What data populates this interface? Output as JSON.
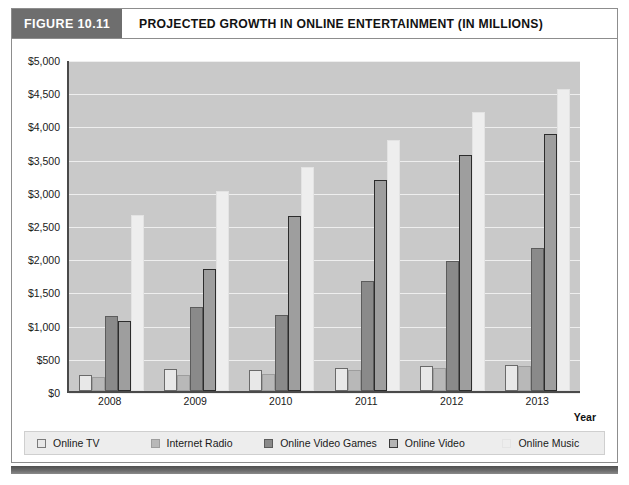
{
  "header": {
    "figure_tag": "FIGURE 10.11",
    "title": "PROJECTED GROWTH IN ONLINE ENTERTAINMENT (IN MILLIONS)"
  },
  "axis": {
    "x_title": "Year",
    "y_ticks": [
      "$0",
      "$500",
      "$1,000",
      "$1,500",
      "$2,000",
      "$2,500",
      "$3,000",
      "$3,500",
      "$4,000",
      "$4,500",
      "$5,000"
    ]
  },
  "legend": {
    "items": [
      {
        "label": "Online TV",
        "swatch": "series-0-swatch",
        "color": "#e8e8e8"
      },
      {
        "label": "Internet Radio",
        "swatch": "series-1-swatch",
        "color": "#b8b8b8"
      },
      {
        "label": "Online Video Games",
        "swatch": "series-2-swatch",
        "color": "#8a8a8a"
      },
      {
        "label": "Online Video",
        "swatch": "series-3-swatch",
        "color": "#b4b4b4"
      },
      {
        "label": "Online Music",
        "swatch": "series-4-swatch",
        "color": "#ededed"
      }
    ]
  },
  "chart_data": {
    "type": "bar",
    "title": "PROJECTED GROWTH IN ONLINE ENTERTAINMENT (IN MILLIONS)",
    "xlabel": "Year",
    "ylabel": "",
    "ylim": [
      0,
      5000
    ],
    "ytick_step": 500,
    "grid": true,
    "legend_position": "bottom",
    "categories": [
      "2008",
      "2009",
      "2010",
      "2011",
      "2012",
      "2013"
    ],
    "series": [
      {
        "name": "Online TV",
        "values": [
          240,
          330,
          320,
          350,
          370,
          390
        ]
      },
      {
        "name": "Internet Radio",
        "values": [
          210,
          240,
          250,
          320,
          340,
          370
        ]
      },
      {
        "name": "Online Video Games",
        "values": [
          1130,
          1260,
          1150,
          1660,
          1960,
          2160
        ]
      },
      {
        "name": "Online Video",
        "values": [
          1050,
          1840,
          2640,
          3180,
          3560,
          3870
        ]
      },
      {
        "name": "Online Music",
        "values": [
          2650,
          3010,
          3370,
          3780,
          4200,
          4550
        ]
      }
    ]
  }
}
